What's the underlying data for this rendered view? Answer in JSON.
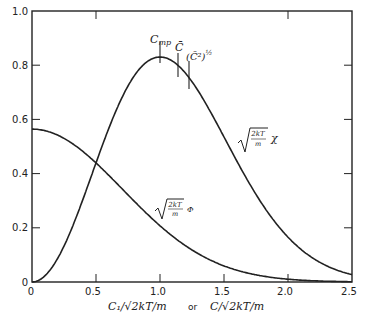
{
  "chart_data": {
    "type": "line",
    "title": "",
    "xlabel": "C1/sqrt(2kT/m) or C/sqrt(2kT/m)",
    "xlabel_parts": {
      "left": "C₁/√2kT/m",
      "or": "or",
      "right": "C/√2kT/m"
    },
    "ylabel": "",
    "xlim": [
      0,
      2.5
    ],
    "ylim": [
      0,
      1.0
    ],
    "grid": false,
    "x_ticks": [
      "0",
      "0.5",
      "1.0",
      "1.5",
      "2.0",
      "2.5"
    ],
    "y_ticks": [
      "0",
      "0.2",
      "0.4",
      "0.6",
      "0.8",
      "1.0"
    ],
    "series": [
      {
        "name": "sqrt(2kT/m) Φ",
        "label": "Φ",
        "x": [
          0,
          0.25,
          0.5,
          0.75,
          1.0,
          1.25,
          1.5,
          1.75,
          2.0,
          2.25,
          2.5
        ],
        "values": [
          0.564,
          0.53,
          0.439,
          0.322,
          0.208,
          0.118,
          0.059,
          0.026,
          0.01,
          0.004,
          0.001
        ]
      },
      {
        "name": "sqrt(2kT/m) χ",
        "label": "χ",
        "x": [
          0,
          0.25,
          0.5,
          0.75,
          1.0,
          1.25,
          1.5,
          1.75,
          2.0,
          2.25,
          2.5
        ],
        "values": [
          0,
          0.133,
          0.439,
          0.725,
          0.83,
          0.738,
          0.532,
          0.316,
          0.166,
          0.063,
          0.012
        ]
      }
    ],
    "annotations": [
      {
        "text": "C_mp",
        "x": 1.0
      },
      {
        "text": "C̄",
        "x": 1.128
      },
      {
        "text": "(C̄²)^½",
        "x": 1.225
      }
    ]
  },
  "labels": {
    "phi_sqrt": "2kT",
    "phi_den": "m",
    "phi_sym": "Φ",
    "chi_sqrt": "2kT",
    "chi_den": "m",
    "chi_sym": "χ",
    "cmp": "C",
    "cmp_sub": "mp",
    "cbar": "C̄",
    "crms": "(C̄²)",
    "crms_exp": "½",
    "x_or": "or",
    "x_left": "C₁/√2kT/m",
    "x_right": "C/√2kT/m"
  }
}
